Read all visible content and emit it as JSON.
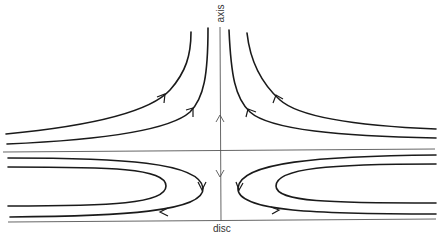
{
  "diagram": {
    "type": "flow-streamlines",
    "labels": {
      "axis": "axis",
      "disc": "disc"
    },
    "colors": {
      "background": "#ffffff",
      "streamline": "#1a1a1a",
      "reference_line": "#555555",
      "label": "#333333"
    },
    "elements": {
      "axis_line": "vertical axis with up arrow above midplane and down arrow below",
      "midplane_line": "horizontal reference line",
      "disc_line": "horizontal disc boundary line at bottom",
      "upper_streamlines": 4,
      "lower_loops": 4
    }
  }
}
